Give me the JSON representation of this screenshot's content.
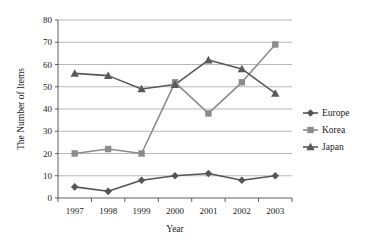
{
  "chart_data": {
    "type": "line",
    "title": "",
    "xlabel": "Year",
    "ylabel": "The Number of Items",
    "categories": [
      "1997",
      "1998",
      "1999",
      "2000",
      "2001",
      "2002",
      "2003"
    ],
    "x": [
      1997,
      1998,
      1999,
      2000,
      2001,
      2002,
      2003
    ],
    "series": [
      {
        "name": "Europe",
        "marker": "diamond",
        "color": "#555555",
        "values": [
          5,
          3,
          8,
          10,
          11,
          8,
          10
        ]
      },
      {
        "name": "Korea",
        "marker": "square",
        "color": "#8c8c8c",
        "values": [
          20,
          22,
          20,
          52,
          38,
          52,
          69
        ]
      },
      {
        "name": "Japan",
        "marker": "triangle",
        "color": "#595959",
        "values": [
          56,
          55,
          49,
          51,
          62,
          58,
          47
        ]
      }
    ],
    "ylim": [
      0,
      80
    ],
    "ytick_values": [
      0,
      10,
      20,
      30,
      40,
      50,
      60,
      70,
      80
    ],
    "ytick_labels": [
      "0",
      "10",
      "20",
      "30",
      "40",
      "50",
      "60",
      "70",
      "80"
    ],
    "grid": true,
    "grid_axis": "y",
    "legend_position": "right",
    "legend_entries": [
      "Europe",
      "Korea",
      "Japan"
    ]
  }
}
